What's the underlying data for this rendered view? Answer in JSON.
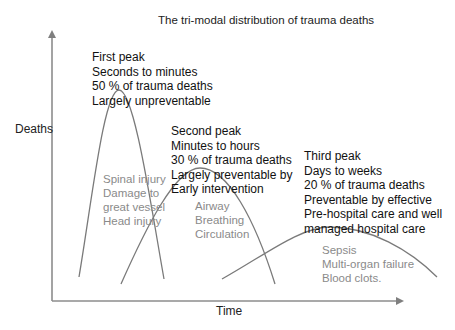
{
  "diagram": {
    "title": "The tri-modal distribution of trauma deaths",
    "y_axis_label": "Deaths",
    "x_axis_label": "Time",
    "colors": {
      "axis": "#8c8c8c",
      "curve": "#7a7a7a",
      "peak_text": "#111111",
      "cause_text": "#8a8a8a"
    },
    "peaks": [
      {
        "name": "First peak",
        "timing": "Seconds to minutes",
        "share": "50 % of trauma deaths",
        "preventability": [
          "Largely unpreventable"
        ],
        "causes": [
          "Spinal injury",
          "Damage to",
          "great vessel",
          "Head injury"
        ]
      },
      {
        "name": "Second peak",
        "timing": "Minutes to hours",
        "share": "30 % of trauma deaths",
        "preventability": [
          "Largely preventable by",
          "Early intervention"
        ],
        "causes": [
          "Airway",
          "Breathing",
          "Circulation"
        ]
      },
      {
        "name": "Third peak",
        "timing": "Days to weeks",
        "share": "20 % of trauma deaths",
        "preventability": [
          "Preventable by effective",
          "Pre-hospital care and well",
          "managed hospital care"
        ],
        "causes": [
          "Sepsis",
          "Multi-organ failure",
          "Blood clots."
        ]
      }
    ]
  }
}
